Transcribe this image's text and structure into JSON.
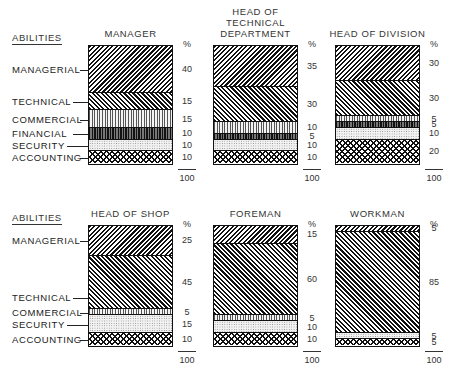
{
  "abilities_header": "ABILITIES",
  "percent_symbol": "%",
  "total_label": "100",
  "categories": [
    "MANAGERIAL",
    "TECHNICAL",
    "COMMERCIAL",
    "FINANCIAL",
    "SECURITY",
    "ACCOUNTING"
  ],
  "top_row_labels": [
    "MANAGERIAL",
    "TECHNICAL",
    "COMMERCIAL",
    "FINANCIAL",
    "SECURITY",
    "ACCOUNTING"
  ],
  "bottom_row_labels": [
    "MANAGERIAL",
    "TECHNICAL",
    "COMMERCIAL",
    "SECURITY",
    "ACCOUNTING"
  ],
  "chart_data": [
    {
      "type": "bar",
      "stacked": true,
      "title": "MANAGER",
      "categories": [
        "MANAGERIAL",
        "TECHNICAL",
        "COMMERCIAL",
        "FINANCIAL",
        "SECURITY",
        "ACCOUNTING"
      ],
      "values": [
        40,
        15,
        15,
        10,
        10,
        10
      ],
      "total": 100,
      "ylabel": "%"
    },
    {
      "type": "bar",
      "stacked": true,
      "title": "HEAD OF TECHNICAL DEPARTMENT",
      "categories": [
        "MANAGERIAL",
        "TECHNICAL",
        "COMMERCIAL",
        "FINANCIAL",
        "SECURITY",
        "ACCOUNTING"
      ],
      "values": [
        35,
        30,
        10,
        5,
        10,
        10
      ],
      "total": 100,
      "ylabel": "%"
    },
    {
      "type": "bar",
      "stacked": true,
      "title": "HEAD OF DIVISION",
      "categories": [
        "MANAGERIAL",
        "TECHNICAL",
        "COMMERCIAL",
        "FINANCIAL",
        "SECURITY",
        "ACCOUNTING"
      ],
      "values": [
        30,
        30,
        5,
        5,
        10,
        20
      ],
      "total": 100,
      "ylabel": "%"
    },
    {
      "type": "bar",
      "stacked": true,
      "title": "HEAD OF SHOP",
      "categories": [
        "MANAGERIAL",
        "TECHNICAL",
        "COMMERCIAL",
        "SECURITY",
        "ACCOUNTING"
      ],
      "values": [
        25,
        45,
        5,
        15,
        10
      ],
      "total": 100,
      "ylabel": "%"
    },
    {
      "type": "bar",
      "stacked": true,
      "title": "FOREMAN",
      "categories": [
        "MANAGERIAL",
        "TECHNICAL",
        "COMMERCIAL",
        "SECURITY",
        "ACCOUNTING"
      ],
      "values": [
        15,
        60,
        5,
        10,
        10
      ],
      "total": 100,
      "ylabel": "%"
    },
    {
      "type": "bar",
      "stacked": true,
      "title": "WORKMAN",
      "categories": [
        "MANAGERIAL",
        "TECHNICAL",
        "SECURITY",
        "ACCOUNTING"
      ],
      "values": [
        5,
        85,
        5,
        5
      ],
      "total": 100,
      "ylabel": "%"
    }
  ]
}
